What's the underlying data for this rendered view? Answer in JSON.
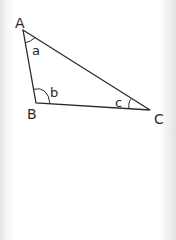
{
  "diagram": {
    "type": "triangle",
    "vertices": [
      {
        "id": "A",
        "label": "A",
        "x": 23,
        "y": 30
      },
      {
        "id": "B",
        "label": "B",
        "x": 36,
        "y": 103
      },
      {
        "id": "C",
        "label": "C",
        "x": 150,
        "y": 110
      }
    ],
    "angles": [
      {
        "vertex": "A",
        "label": "a"
      },
      {
        "vertex": "B",
        "label": "b"
      },
      {
        "vertex": "C",
        "label": "c"
      }
    ],
    "line_color": "#2a2a2a"
  }
}
